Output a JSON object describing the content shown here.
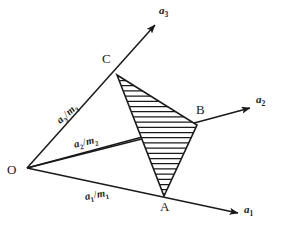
{
  "figure": {
    "background_color": "#ffffff",
    "stroke_color": "#1a1a1a",
    "width": 282,
    "height": 237
  },
  "origin": {
    "label": "O",
    "x": 27,
    "y": 168,
    "label_x": 7,
    "label_y": 165
  },
  "axes": [
    {
      "name": "a1",
      "label_base": "a",
      "label_sub": "1",
      "tip_x": 238,
      "tip_y": 213,
      "label_x": 244,
      "label_y": 205,
      "intercept_label_base": "a",
      "intercept_label_sub": "1",
      "intercept_label_den_base": "m",
      "intercept_label_den_sub": "1",
      "intercept_label_x": 84,
      "intercept_label_y": 192,
      "intercept_label_rotate": -10
    },
    {
      "name": "a2",
      "label_base": "a",
      "label_sub": "2",
      "tip_x": 250,
      "tip_y": 108,
      "label_x": 256,
      "label_y": 95,
      "intercept_label_base": "a",
      "intercept_label_sub": "2",
      "intercept_label_den_base": "m",
      "intercept_label_den_sub": "2",
      "intercept_label_x": 73,
      "intercept_label_y": 140,
      "intercept_label_rotate": -13
    },
    {
      "name": "a3",
      "label_base": "a",
      "label_sub": "3",
      "tip_x": 155,
      "tip_y": 25,
      "label_x": 159,
      "label_y": 6,
      "intercept_label_base": "a",
      "intercept_label_sub": "3",
      "intercept_label_den_base": "m",
      "intercept_label_den_sub": "3",
      "intercept_label_x": 55,
      "intercept_label_y": 118,
      "intercept_label_rotate": -42
    }
  ],
  "vertices": [
    {
      "label": "A",
      "x": 164,
      "y": 196,
      "label_x": 160,
      "label_y": 201
    },
    {
      "label": "B",
      "x": 197,
      "y": 125,
      "label_x": 196,
      "label_y": 104
    },
    {
      "label": "C",
      "x": 117,
      "y": 75,
      "label_x": 102,
      "label_y": 53
    }
  ],
  "plane": {
    "name": "hatched-triangle-ABC",
    "fill_pattern": "horizontal-hatch",
    "hatch_spacing": 5.2,
    "hatch_color": "#1a1a1a"
  }
}
